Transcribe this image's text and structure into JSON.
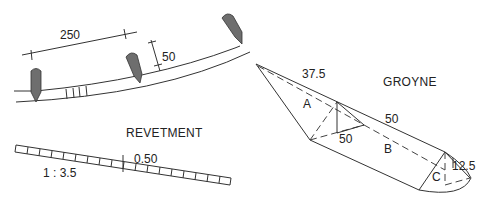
{
  "diagram": {
    "type": "coastal-protection-structures",
    "colors": {
      "line": "#333333",
      "groyne_fill": "#6e6e6e",
      "text": "#222222",
      "background": "#ffffff"
    }
  },
  "plan_view": {
    "groyne_spacing_label": "250",
    "groyne_length_label": "50",
    "groyne_count": 3
  },
  "revetment": {
    "title": "REVETMENT",
    "slope_label": "1 : 3.5",
    "thickness_label": "0.50"
  },
  "groyne": {
    "title": "GROYNE",
    "dimension_labels": {
      "root_length": "37.5",
      "trunk_length": "50",
      "width": "50",
      "head_height": "12.5"
    },
    "section_labels": {
      "a": "A",
      "b": "B",
      "c": "C"
    }
  }
}
